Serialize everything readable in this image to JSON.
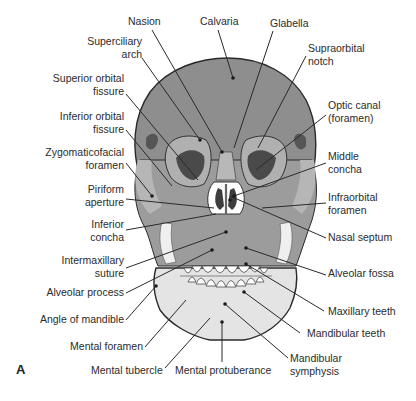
{
  "figure": {
    "panel_letter": "A",
    "colors": {
      "cranium": "#8e8e8e",
      "face_light": "#b4b4b4",
      "mandible": "#e2e2e2",
      "orbit_dark": "#4a4a4a",
      "outline": "#2a2a2a",
      "leader_line": "#2a2a2a",
      "text": "#2b2b2b"
    },
    "labels_left": [
      {
        "id": "superciliary-arch",
        "lines": [
          "Superciliary",
          "arch"
        ]
      },
      {
        "id": "superior-orbital-fissure",
        "lines": [
          "Superior orbital",
          "fissure"
        ]
      },
      {
        "id": "inferior-orbital-fissure",
        "lines": [
          "Inferior orbital",
          "fissure"
        ]
      },
      {
        "id": "zygomaticofacial-foramen",
        "lines": [
          "Zygomaticofacial",
          "foramen"
        ]
      },
      {
        "id": "piriform-aperture",
        "lines": [
          "Piriform",
          "aperture"
        ]
      },
      {
        "id": "inferior-concha",
        "lines": [
          "Inferior",
          "concha"
        ]
      },
      {
        "id": "intermaxillary-suture",
        "lines": [
          "Intermaxillary",
          "suture"
        ]
      },
      {
        "id": "alveolar-process",
        "lines": [
          "Alveolar process"
        ]
      },
      {
        "id": "angle-of-mandible",
        "lines": [
          "Angle of mandible"
        ]
      },
      {
        "id": "mental-foramen",
        "lines": [
          "Mental foramen"
        ]
      }
    ],
    "labels_top": [
      {
        "id": "nasion",
        "lines": [
          "Nasion"
        ]
      },
      {
        "id": "calvaria",
        "lines": [
          "Calvaria"
        ]
      },
      {
        "id": "glabella",
        "lines": [
          "Glabella"
        ]
      }
    ],
    "labels_right": [
      {
        "id": "supraorbital-notch",
        "lines": [
          "Supraorbital",
          "notch"
        ]
      },
      {
        "id": "optic-canal",
        "lines": [
          "Optic canal",
          "(foramen)"
        ]
      },
      {
        "id": "middle-concha",
        "lines": [
          "Middle",
          "concha"
        ]
      },
      {
        "id": "infraorbital-foramen",
        "lines": [
          "Infraorbital",
          "foramen"
        ]
      },
      {
        "id": "nasal-septum",
        "lines": [
          "Nasal septum"
        ]
      },
      {
        "id": "alveolar-fossa",
        "lines": [
          "Alveolar fossa"
        ]
      },
      {
        "id": "maxillary-teeth",
        "lines": [
          "Maxillary teeth"
        ]
      },
      {
        "id": "mandibular-teeth",
        "lines": [
          "Mandibular teeth"
        ]
      },
      {
        "id": "mandibular-symphysis",
        "lines": [
          "Mandibular",
          "symphysis"
        ]
      }
    ],
    "labels_bottom": [
      {
        "id": "mental-tubercle",
        "lines": [
          "Mental tubercle"
        ]
      },
      {
        "id": "mental-protuberance",
        "lines": [
          "Mental protuberance"
        ]
      }
    ]
  }
}
